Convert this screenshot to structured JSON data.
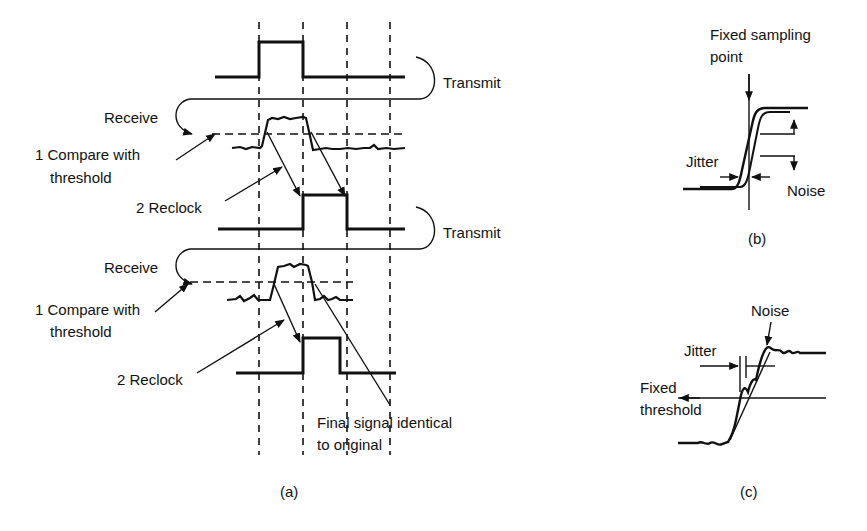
{
  "panel_a": {
    "caption": "(a)",
    "stage1": {
      "transmit_label": "Transmit",
      "receive_label": "Receive",
      "compare_label_line1": "1 Compare with",
      "compare_label_line2": "threshold",
      "reclock_label": "2 Reclock"
    },
    "stage2": {
      "transmit_label": "Transmit",
      "receive_label": "Receive",
      "compare_label_line1": "1 Compare with",
      "compare_label_line2": "threshold",
      "reclock_label": "2 Reclock"
    },
    "final_label_line1": "Final signal identical",
    "final_label_line2": "to original"
  },
  "panel_b": {
    "caption": "(b)",
    "sampling_label_line1": "Fixed sampling",
    "sampling_label_line2": "point",
    "jitter_label": "Jitter",
    "noise_label": "Noise"
  },
  "panel_c": {
    "caption": "(c)",
    "noise_label": "Noise",
    "jitter_label": "Jitter",
    "threshold_label_line1": "Fixed",
    "threshold_label_line2": "threshold"
  }
}
